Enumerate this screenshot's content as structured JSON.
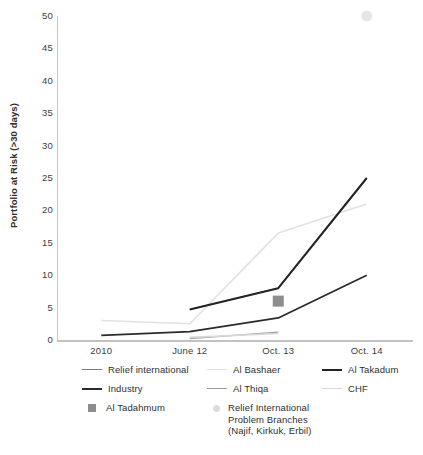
{
  "chart_data": {
    "type": "line",
    "title": "",
    "xlabel": "",
    "ylabel": "Portfolio at Risk (>30 days)",
    "categories": [
      "2010",
      "June 12",
      "Oct. 13",
      "Oct. 14"
    ],
    "ylim": [
      0,
      50
    ],
    "ytick_step": 5,
    "ytick_labels": [
      "50",
      "45",
      "40",
      "35",
      "30",
      "25",
      "20",
      "15",
      "10",
      "5",
      "0"
    ],
    "grid": false,
    "legend_position": "bottom",
    "series": [
      {
        "name": "Relief international",
        "marker": "line",
        "color": "#7a7a7a",
        "width": 1.2,
        "x": [
          "June 12",
          "Oct. 13",
          "Oct. 14"
        ],
        "values": [
          4.7,
          8.0,
          25.0
        ]
      },
      {
        "name": "Al Bashaer",
        "marker": "line",
        "color": "#e2e2e2",
        "width": 1.6,
        "x": [
          "2010",
          "June 12",
          "Oct. 13",
          "Oct. 14"
        ],
        "values": [
          3.0,
          2.5,
          16.5,
          21.0
        ]
      },
      {
        "name": "Al Takadum",
        "marker": "line",
        "color": "#242424",
        "width": 2.0,
        "x": [
          "June 12",
          "Oct. 13",
          "Oct. 14"
        ],
        "values": [
          4.7,
          8.0,
          25.0
        ]
      },
      {
        "name": "Industry",
        "marker": "line",
        "color": "#2b2b2b",
        "width": 1.8,
        "x": [
          "2010",
          "June 12",
          "Oct. 13",
          "Oct. 14"
        ],
        "values": [
          0.7,
          1.3,
          3.4,
          10.0
        ]
      },
      {
        "name": "Al Thiqa",
        "marker": "line",
        "color": "#9e9e9e",
        "width": 1.2,
        "x": [
          "June 12",
          "Oct. 13"
        ],
        "values": [
          0.2,
          1.2
        ]
      },
      {
        "name": "CHF",
        "marker": "line",
        "color": "#d8d8d8",
        "width": 1.6,
        "x": [
          "June 12",
          "Oct. 13"
        ],
        "values": [
          0.4,
          1.0
        ]
      },
      {
        "name": "Al Tadahmum",
        "marker": "square",
        "color": "#8d8d8d",
        "x": [
          "Oct. 13"
        ],
        "values": [
          6.0
        ]
      },
      {
        "name": "Relief International Problem Branches (Najif, Kirkuk, Erbil)",
        "marker": "dot",
        "color": "#e6e6e6",
        "x": [
          "Oct. 14"
        ],
        "values": [
          50.0
        ]
      }
    ]
  },
  "legend": {
    "items": [
      {
        "label": "Relief international",
        "marker": "line",
        "color": "#7a7a7a",
        "thickness": 1.2
      },
      {
        "label": "Al Bashaer",
        "marker": "line",
        "color": "#e0e0e0",
        "thickness": 1.6
      },
      {
        "label": "Al Takadum",
        "marker": "line",
        "color": "#242424",
        "thickness": 2.2
      },
      {
        "label": "Industry",
        "marker": "line",
        "color": "#2b2b2b",
        "thickness": 2.0
      },
      {
        "label": "Al Thiqa",
        "marker": "line",
        "color": "#9e9e9e",
        "thickness": 1.2
      },
      {
        "label": "CHF",
        "marker": "line",
        "color": "#d8d8d8",
        "thickness": 1.4
      },
      {
        "label": "Al Tadahmum",
        "marker": "square",
        "color": "#8d8d8d"
      },
      {
        "label": "Relief International\nProblem Branches\n(Najif, Kirkuk, Erbil)",
        "marker": "dot",
        "color": "#dcdcdc"
      }
    ]
  }
}
